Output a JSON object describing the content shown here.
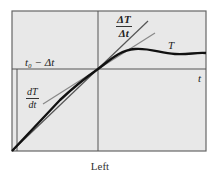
{
  "figure": {
    "caption": "Left",
    "colors": {
      "panel_fill": "#e8e8e8",
      "frame": "#666666",
      "axis": "#555555",
      "curve": "#111111",
      "secant": "#555555",
      "tangent": "#888888"
    },
    "labels": {
      "t0_minus_dt": "t₀ − Δt",
      "t_axis": "t",
      "curve_T": "T",
      "secant_num": "ΔT",
      "secant_den": "Δt",
      "tangent_num": "dT",
      "tangent_den": "dt"
    }
  }
}
